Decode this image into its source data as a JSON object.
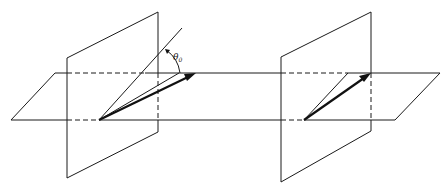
{
  "figure": {
    "colors": {
      "line": "#1a1a1a",
      "arrow": "#111111",
      "background": "#ffffff"
    },
    "left_panel": {
      "angle_label": {
        "symbol": "θ",
        "subscript": "0"
      }
    },
    "right_panel": {}
  }
}
